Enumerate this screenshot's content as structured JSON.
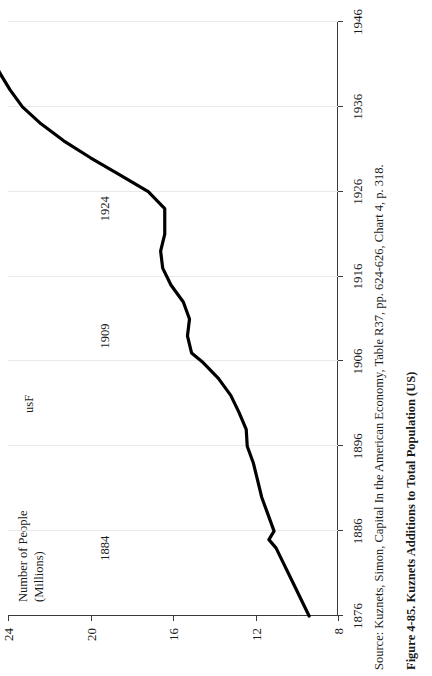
{
  "chart_data": {
    "type": "line",
    "title": "",
    "xlabel": "",
    "ylabel": "Number of People\n(Millions)",
    "xlim": [
      1876,
      1946
    ],
    "ylim": [
      8,
      24
    ],
    "xticks": [
      1876,
      1886,
      1896,
      1906,
      1916,
      1926,
      1936,
      1946
    ],
    "yticks": [
      8,
      12,
      16,
      20,
      24
    ],
    "grid": "vertical-light",
    "legend": "none",
    "line_color": "#000000",
    "series": [
      {
        "name": "usF",
        "x": [
          1876,
          1878,
          1880,
          1882,
          1884,
          1885,
          1886,
          1888,
          1890,
          1892,
          1894,
          1896,
          1898,
          1900,
          1902,
          1904,
          1906,
          1907,
          1909,
          1911,
          1913,
          1915,
          1917,
          1919,
          1921,
          1924,
          1926,
          1928,
          1930,
          1932,
          1934,
          1936,
          1938,
          1940,
          1942,
          1944,
          1946
        ],
        "values": [
          9.4,
          9.8,
          10.2,
          10.6,
          11.0,
          11.35,
          11.1,
          11.4,
          11.7,
          11.9,
          12.1,
          12.4,
          12.45,
          12.8,
          13.2,
          13.8,
          14.6,
          15.1,
          15.3,
          15.2,
          15.5,
          16.1,
          16.5,
          16.6,
          16.4,
          16.4,
          17.2,
          18.6,
          20.0,
          21.3,
          22.4,
          23.3,
          23.9,
          24.4,
          24.8,
          25.1,
          25.3
        ]
      }
    ],
    "annotations": [
      {
        "text": "1884",
        "x": 1884,
        "y": 19.3
      },
      {
        "text": "1909",
        "x": 1909,
        "y": 19.3
      },
      {
        "text": "1924",
        "x": 1924,
        "y": 19.3
      },
      {
        "text": "usF",
        "x": 1901,
        "y": 23.0
      }
    ]
  },
  "figure": {
    "source": "Source: Kuznets, Simon, Capital In the American Economy, Table R37, pp. 624-626, Chart 4, p. 318.",
    "caption": "Figure 4-85.  Kuznets Additions to Total Population (US)"
  }
}
